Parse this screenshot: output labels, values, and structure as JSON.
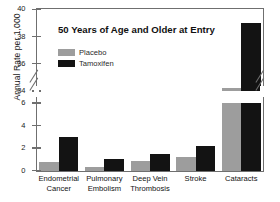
{
  "chart_data": {
    "type": "bar",
    "title": "50 Years of Age and Older at Entry",
    "xlabel": "",
    "ylabel": "Annual Rate per 1,000",
    "categories": [
      "Endometrial Cancer",
      "Pulmonary Embolism",
      "Deep Vein Thrombosis",
      "Stroke",
      "Cataracts"
    ],
    "category_lines": [
      [
        "Endometrial",
        "Cancer"
      ],
      [
        "Pulmonary",
        "Embolism"
      ],
      [
        "Deep Vein",
        "Thrombosis"
      ],
      [
        "Stroke",
        ""
      ],
      [
        "Cataracts",
        ""
      ]
    ],
    "series": [
      {
        "name": "Placebo",
        "color": "#9d9d9d",
        "values": [
          0.75,
          0.3,
          0.85,
          1.25,
          34.2
        ]
      },
      {
        "name": "Tamoxifen",
        "color": "#131313",
        "values": [
          3.0,
          1.0,
          1.5,
          2.2,
          39.0
        ]
      }
    ],
    "axis_broken": true,
    "ylim_lower": [
      0,
      6
    ],
    "ylim_upper": [
      34,
      40
    ],
    "yticks_lower": [
      0,
      2,
      4,
      6
    ],
    "yticks_upper": [
      34,
      36,
      38,
      40
    ],
    "ytick_labels": [
      "0",
      "2",
      "4",
      "6",
      "34",
      "36",
      "38",
      "40"
    ],
    "grid": false,
    "legend_position": "upper-left"
  },
  "legend": {
    "entries": [
      {
        "label": "Placebo"
      },
      {
        "label": "Tamoxifen"
      }
    ]
  }
}
